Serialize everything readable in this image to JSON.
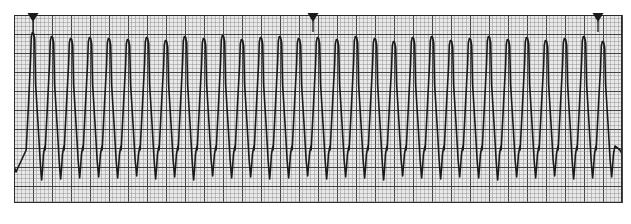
{
  "page": {
    "background_color": "#ffffff",
    "width": 631,
    "height": 224
  },
  "strip": {
    "name": "ecg-rhythm-strip",
    "paper_color": "#e9e9e9",
    "fine_grid_color": "#8a8a8a",
    "bold_grid_color": "#3a3a3a",
    "border_color": "#2b2b2b",
    "trace_color": "#1a1a1a",
    "trace_width": 1.6,
    "plot_left": 14,
    "plot_top": 15,
    "plot_right": 622,
    "plot_bottom": 203,
    "fine_grid_px": 3.8,
    "bold_every": 5
  },
  "markers": {
    "name": "calibration-markers",
    "shape": "triangle-down-with-stem",
    "color": "#1a1a1a",
    "positions_x": [
      33,
      313,
      598
    ],
    "top_y": 13,
    "triangle_width": 11,
    "triangle_height": 9,
    "stem_length": 10
  },
  "chart_data": {
    "type": "line",
    "subtitle": "",
    "xlabel": "",
    "ylabel": "",
    "grid": true,
    "legend": null,
    "xlim": [
      14,
      622
    ],
    "ylim": [
      203,
      15
    ],
    "baseline_y": 120,
    "peak_y": 36,
    "trough_y": 178,
    "cycle_period_px": 19.0,
    "complex_count": 31,
    "waveform": {
      "description": "Regular wide-complex tachycardia: tall rounded positive deflection followed by deep narrow negative deflection, repeating continuously across the strip",
      "upstroke_fraction": 0.18,
      "peak_plateau_fraction": 0.1,
      "downstroke_fraction": 0.34,
      "trough_fraction": 0.06,
      "recovery_fraction": 0.32,
      "amplitude_jitter_px": 3.0,
      "period_jitter_px": 1.2
    },
    "complexes": [
      {
        "index": 1,
        "peak_x": 33,
        "peak_y": 32,
        "trough_y": 180
      },
      {
        "index": 2,
        "peak_x": 52,
        "peak_y": 36,
        "trough_y": 179
      },
      {
        "index": 3,
        "peak_x": 71,
        "peak_y": 38,
        "trough_y": 178
      },
      {
        "index": 4,
        "peak_x": 90,
        "peak_y": 37,
        "trough_y": 177
      },
      {
        "index": 5,
        "peak_x": 109,
        "peak_y": 38,
        "trough_y": 178
      },
      {
        "index": 6,
        "peak_x": 128,
        "peak_y": 39,
        "trough_y": 176
      },
      {
        "index": 7,
        "peak_x": 147,
        "peak_y": 37,
        "trough_y": 179
      },
      {
        "index": 8,
        "peak_x": 166,
        "peak_y": 40,
        "trough_y": 177
      },
      {
        "index": 9,
        "peak_x": 185,
        "peak_y": 36,
        "trough_y": 180
      },
      {
        "index": 10,
        "peak_x": 204,
        "peak_y": 38,
        "trough_y": 176
      },
      {
        "index": 11,
        "peak_x": 223,
        "peak_y": 35,
        "trough_y": 178
      },
      {
        "index": 12,
        "peak_x": 242,
        "peak_y": 39,
        "trough_y": 177
      },
      {
        "index": 13,
        "peak_x": 261,
        "peak_y": 37,
        "trough_y": 179
      },
      {
        "index": 14,
        "peak_x": 280,
        "peak_y": 36,
        "trough_y": 178
      },
      {
        "index": 15,
        "peak_x": 299,
        "peak_y": 38,
        "trough_y": 176
      },
      {
        "index": 16,
        "peak_x": 318,
        "peak_y": 37,
        "trough_y": 179
      },
      {
        "index": 17,
        "peak_x": 337,
        "peak_y": 39,
        "trough_y": 177
      },
      {
        "index": 18,
        "peak_x": 356,
        "peak_y": 36,
        "trough_y": 178
      },
      {
        "index": 19,
        "peak_x": 375,
        "peak_y": 38,
        "trough_y": 180
      },
      {
        "index": 20,
        "peak_x": 394,
        "peak_y": 41,
        "trough_y": 176
      },
      {
        "index": 21,
        "peak_x": 413,
        "peak_y": 37,
        "trough_y": 178
      },
      {
        "index": 22,
        "peak_x": 432,
        "peak_y": 36,
        "trough_y": 179
      },
      {
        "index": 23,
        "peak_x": 451,
        "peak_y": 40,
        "trough_y": 177
      },
      {
        "index": 24,
        "peak_x": 470,
        "peak_y": 38,
        "trough_y": 178
      },
      {
        "index": 25,
        "peak_x": 489,
        "peak_y": 36,
        "trough_y": 180
      },
      {
        "index": 26,
        "peak_x": 508,
        "peak_y": 39,
        "trough_y": 177
      },
      {
        "index": 27,
        "peak_x": 527,
        "peak_y": 37,
        "trough_y": 178
      },
      {
        "index": 28,
        "peak_x": 546,
        "peak_y": 40,
        "trough_y": 176
      },
      {
        "index": 29,
        "peak_x": 565,
        "peak_y": 38,
        "trough_y": 179
      },
      {
        "index": 30,
        "peak_x": 584,
        "peak_y": 36,
        "trough_y": 178
      },
      {
        "index": 31,
        "peak_x": 603,
        "peak_y": 41,
        "trough_y": 177
      }
    ]
  }
}
